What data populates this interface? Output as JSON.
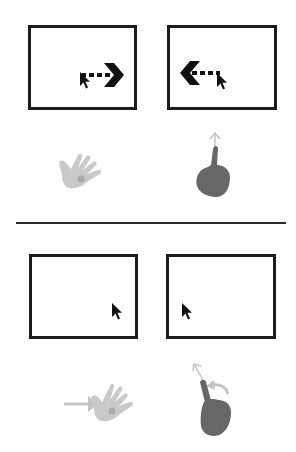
{
  "title": "Gesture to cursor mapping diagram",
  "colors": {
    "screen_border": "#1c1c1c",
    "cursor": "#111111",
    "arrow": "#111111",
    "open_hand": "#c9c9c9",
    "palm_dot": "#a9a9a9",
    "fist": "#676767",
    "motion_arrow": "#c4c4c4",
    "divider": "#2a2a2a"
  },
  "sections": [
    {
      "name": "top",
      "panels": [
        {
          "screen": "screen-left",
          "cursor_motion": "right",
          "gesture": "open-hand",
          "gesture_label": "Open hand"
        },
        {
          "screen": "screen-right",
          "cursor_motion": "left",
          "gesture": "point-up",
          "gesture_label": "Index finger up"
        }
      ]
    },
    {
      "name": "bottom",
      "panels": [
        {
          "screen": "screen-left",
          "cursor_motion": "none",
          "gesture": "open-hand-push",
          "gesture_label": "Open hand pushed right"
        },
        {
          "screen": "screen-right",
          "cursor_motion": "none",
          "gesture": "point-rotate",
          "gesture_label": "Index finger up with rotation"
        }
      ]
    }
  ]
}
